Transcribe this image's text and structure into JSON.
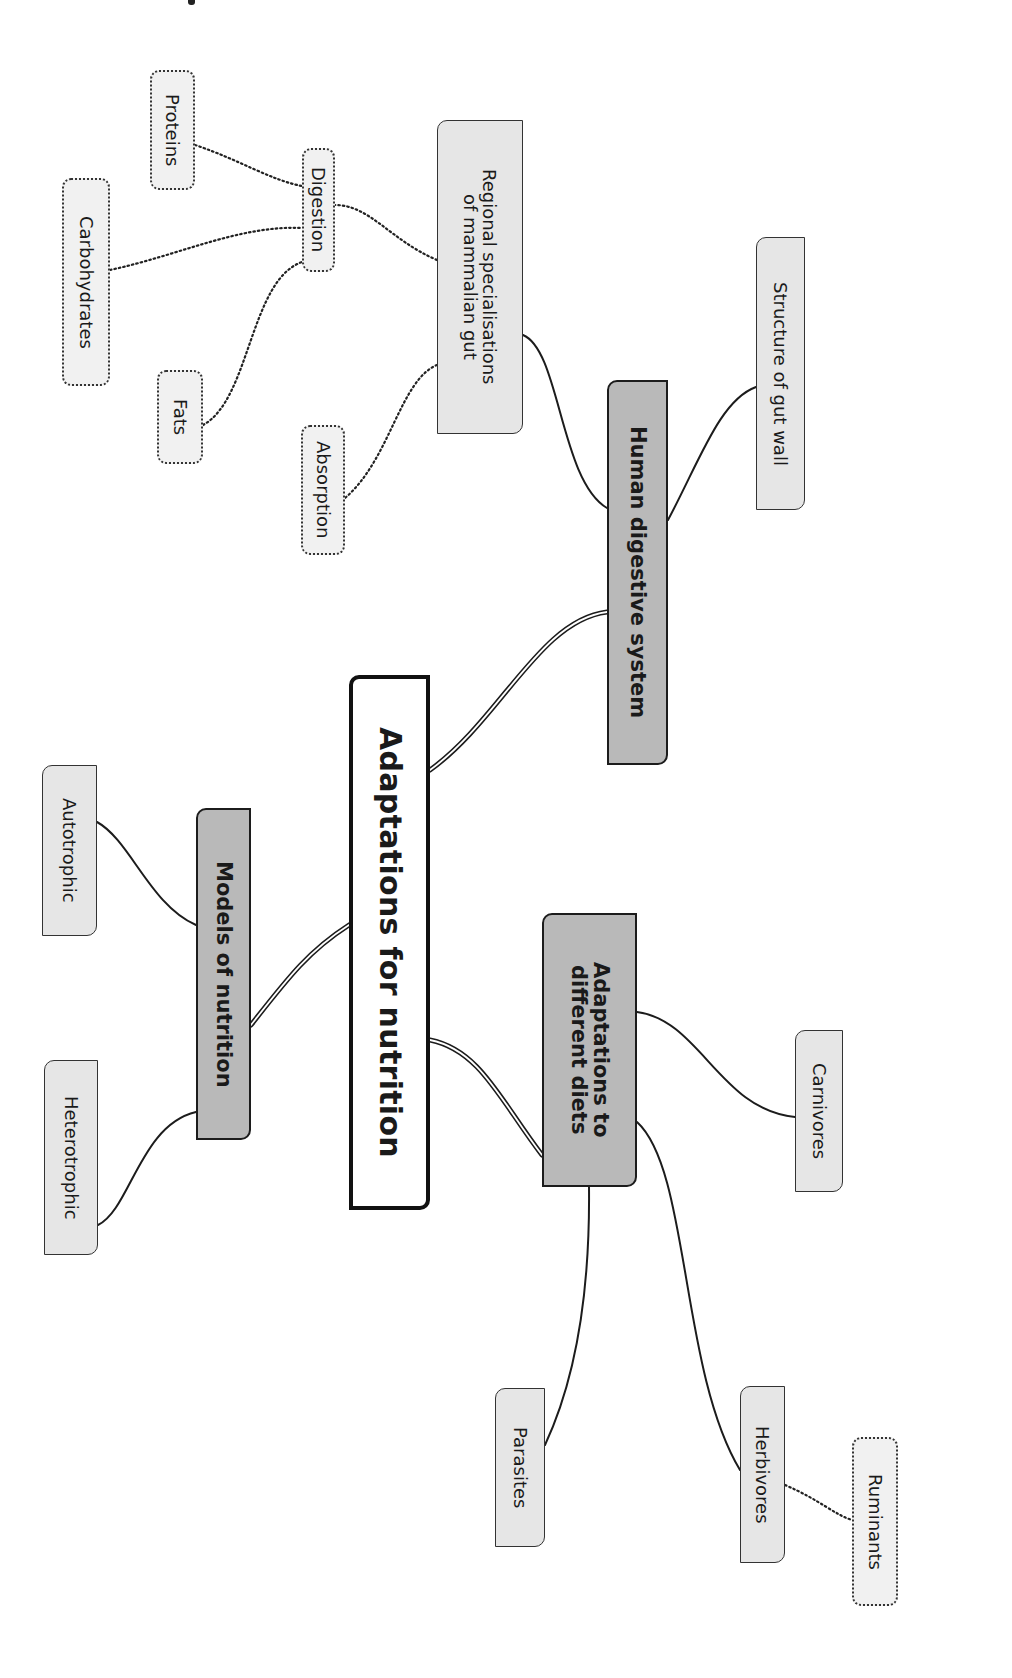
{
  "colors": {
    "central_fill": "#ffffff",
    "main_fill": "#b9b9b9",
    "sub_fill": "#e6e6e6",
    "leaf_fill": "#f1f1f1",
    "stroke": "#1c1c1c"
  },
  "central": {
    "label": "Adaptations for nutrition"
  },
  "branches": {
    "human_digestive": {
      "label": "Human digestive system",
      "children": {
        "structure": {
          "label": "Structure of gut wall"
        },
        "regional": {
          "label": "Regional specialisations\nof mammalian gut",
          "children": {
            "digestion": {
              "label": "Digestion",
              "children": {
                "proteins": {
                  "label": "Proteins"
                },
                "carbohydrates": {
                  "label": "Carbohydrates"
                },
                "fats": {
                  "label": "Fats"
                }
              }
            },
            "absorption": {
              "label": "Absorption"
            }
          }
        }
      }
    },
    "models": {
      "label": "Models of nutrition",
      "children": {
        "autotrophic": {
          "label": "Autotrophic"
        },
        "heterotrophic": {
          "label": "Heterotrophic"
        }
      }
    },
    "diets": {
      "label": "Adaptations to\ndifferent diets",
      "children": {
        "carnivores": {
          "label": "Carnivores"
        },
        "parasites": {
          "label": "Parasites"
        },
        "herbivores": {
          "label": "Herbivores",
          "children": {
            "ruminants": {
              "label": "Ruminants"
            }
          }
        }
      }
    }
  }
}
